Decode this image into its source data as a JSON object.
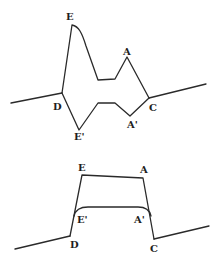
{
  "diagrams": {
    "top": {
      "labels": {
        "E": "E",
        "A": "A",
        "D": "D",
        "C": "C",
        "E_prime": "E'",
        "A_prime": "A'"
      }
    },
    "bottom": {
      "labels": {
        "E": "E",
        "A": "A",
        "D": "D",
        "C": "C",
        "E_prime": "E'",
        "A_prime": "A'"
      }
    }
  },
  "colors": {
    "stroke": "#2a2a2a",
    "background": "#ffffff"
  }
}
